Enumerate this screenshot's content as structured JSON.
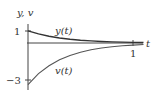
{
  "chart_data": {
    "type": "line",
    "title": "",
    "xlabel": "t",
    "ylabel": "y, v",
    "xlim": [
      0,
      1.1
    ],
    "ylim": [
      -3.4,
      1.3
    ],
    "xticks": [
      {
        "value": 1,
        "label": "1"
      }
    ],
    "yticks": [
      {
        "value": 1,
        "label": "1"
      },
      {
        "value": -3,
        "label": "−3"
      }
    ],
    "grid": false,
    "legend": "inline labels",
    "series": [
      {
        "name": "y(t)",
        "x": [
          0,
          0.1,
          0.2,
          0.3,
          0.4,
          0.5,
          0.6,
          0.7,
          0.8,
          0.9,
          1.0,
          1.1
        ],
        "values": [
          1.0,
          0.74,
          0.55,
          0.41,
          0.3,
          0.22,
          0.17,
          0.12,
          0.09,
          0.07,
          0.05,
          0.04
        ]
      },
      {
        "name": "v(t)",
        "x": [
          0,
          0.1,
          0.2,
          0.3,
          0.4,
          0.5,
          0.6,
          0.7,
          0.8,
          0.9,
          1.0,
          1.1
        ],
        "values": [
          -3.4,
          -2.5,
          -1.85,
          -1.37,
          -1.01,
          -0.75,
          -0.55,
          -0.41,
          -0.3,
          -0.22,
          -0.17,
          -0.12
        ]
      }
    ],
    "annotations": [
      {
        "text": "y(t)",
        "near_series": "y(t)"
      },
      {
        "text": "v(t)",
        "near_series": "v(t)"
      }
    ]
  },
  "labels": {
    "y_axis": "y, v",
    "x_axis": "t",
    "tick_y_1": "1",
    "tick_y_neg3": "−3",
    "tick_x_1": "1",
    "series_y": "y(t)",
    "series_v": "v(t)"
  }
}
